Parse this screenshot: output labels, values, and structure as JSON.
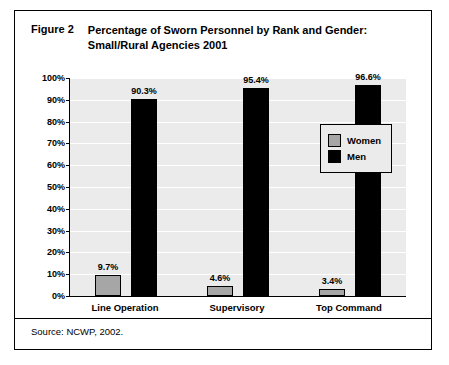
{
  "figure": {
    "label": "Figure 2",
    "title_line1": "Percentage of Sworn Personnel by Rank and Gender:",
    "title_line2": "Small/Rural Agencies 2001",
    "source": "Source: NCWP, 2002."
  },
  "legend": {
    "items": [
      {
        "name": "Women",
        "color": "#a6a6a6"
      },
      {
        "name": "Men",
        "color": "#000000"
      }
    ]
  },
  "chart_data": {
    "type": "bar",
    "title": "Percentage of Sworn Personnel by Rank and Gender: Small/Rural Agencies 2001",
    "xlabel": "",
    "ylabel": "",
    "categories": [
      "Line Operation",
      "Supervisory",
      "Top Command"
    ],
    "series": [
      {
        "name": "Women",
        "color": "#a6a6a6",
        "values": [
          9.7,
          4.6,
          3.4
        ],
        "labels": [
          "9.7%",
          "4.6%",
          "3.4%"
        ]
      },
      {
        "name": "Men",
        "color": "#000000",
        "values": [
          90.3,
          95.4,
          96.6
        ],
        "labels": [
          "90.3%",
          "95.4%",
          "96.6%"
        ]
      }
    ],
    "ylim": [
      0,
      100
    ],
    "yticks": [
      0,
      10,
      20,
      30,
      40,
      50,
      60,
      70,
      80,
      90,
      100
    ],
    "ytick_labels": [
      "0%",
      "10%",
      "20%",
      "30%",
      "40%",
      "50%",
      "60%",
      "70%",
      "80%",
      "90%",
      "100%"
    ],
    "grid": true,
    "legend_position": "upper-right-inside"
  }
}
